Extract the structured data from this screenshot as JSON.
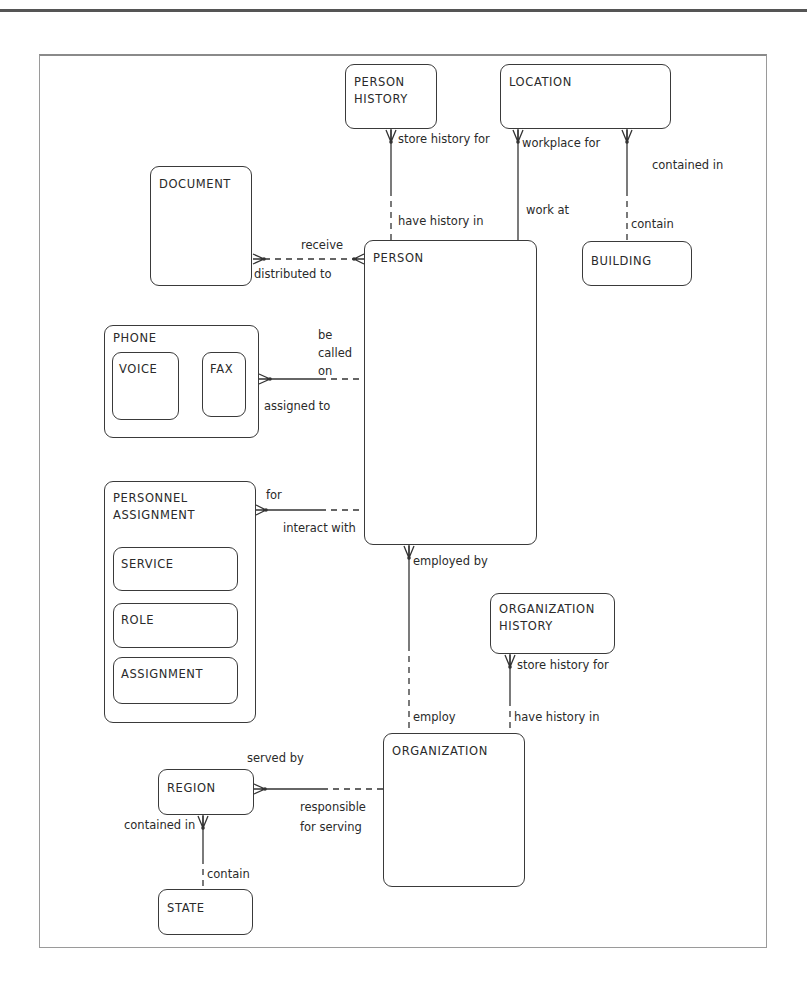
{
  "entities": {
    "person_history": {
      "name": "PERSON\nHISTORY"
    },
    "location": {
      "name": "LOCATION"
    },
    "document": {
      "name": "DOCUMENT"
    },
    "person": {
      "name": "PERSON"
    },
    "building": {
      "name": "BUILDING"
    },
    "phone": {
      "name": "PHONE"
    },
    "voice": {
      "name": "VOICE"
    },
    "fax": {
      "name": "FAX"
    },
    "personnel_assignment": {
      "name": "PERSONNEL\nASSIGNMENT"
    },
    "service": {
      "name": "SERVICE"
    },
    "role": {
      "name": "ROLE"
    },
    "assignment": {
      "name": "ASSIGNMENT"
    },
    "organization_history": {
      "name": "ORGANIZATION\nHISTORY"
    },
    "organization": {
      "name": "ORGANIZATION"
    },
    "region": {
      "name": "REGION"
    },
    "state": {
      "name": "STATE"
    }
  },
  "relationships": {
    "person_history_person": {
      "top": "store history for",
      "bottom": "have history in"
    },
    "location_person": {
      "top": "workplace for",
      "bottom": "work at"
    },
    "location_building": {
      "top": "contained in",
      "bottom": "contain"
    },
    "document_person": {
      "top": "receive",
      "bottom": "distributed to"
    },
    "phone_person": {
      "top": "be\ncalled\non",
      "bottom": "assigned to"
    },
    "assignment_person": {
      "top": "for",
      "bottom": "interact with"
    },
    "person_organization": {
      "top": "employed by",
      "bottom": "employ"
    },
    "orghistory_organization": {
      "top": "store history for",
      "bottom": "have history in"
    },
    "region_organization": {
      "top": "served by",
      "bottom": "responsible\nfor serving"
    },
    "region_state": {
      "top": "contained in",
      "bottom": "contain"
    }
  }
}
